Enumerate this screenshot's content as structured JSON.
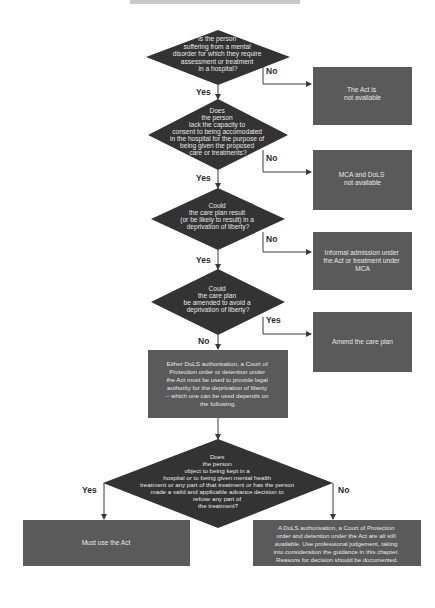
{
  "colors": {
    "diamond": "#333333",
    "box": "#5a5a5a",
    "line": "#3a3a3a",
    "text": "#e6e6e6",
    "label": "#2a2a2a"
  },
  "flowchart": {
    "decisions": [
      {
        "id": "d1",
        "lines": [
          "Is the person",
          "suffering from a mental",
          "disorder for which they require",
          "assessment or treatment",
          "in a hospital?"
        ]
      },
      {
        "id": "d2",
        "lines": [
          "Does",
          "the person",
          "lack the capacity to",
          "consent to being accomodated",
          "in the hospital for the purpose of",
          "being given the proposed",
          "care or treatments?"
        ]
      },
      {
        "id": "d3",
        "lines": [
          "Could",
          "the care plan result",
          "(or be likely to result) in a",
          "deprivation of liberty?"
        ]
      },
      {
        "id": "d4",
        "lines": [
          "Could",
          "the care plan",
          "be amended to avoid a",
          "deprivation of liberty?"
        ]
      },
      {
        "id": "d5",
        "lines": [
          "Does",
          "the person",
          "object to being kept in a",
          "hospital or to being given mental health",
          "treatment or any part of that treatment or has the person",
          "made a valid and applicable advance decision to",
          "refuse any part of",
          "the treatment?"
        ]
      }
    ],
    "outcomes": [
      {
        "id": "o1",
        "lines": [
          "The Act is",
          "not available"
        ]
      },
      {
        "id": "o2",
        "lines": [
          "MCA and DoLS",
          "not available"
        ]
      },
      {
        "id": "o3",
        "lines": [
          "Informal admission under",
          "the Act or treatment under",
          "MCA"
        ]
      },
      {
        "id": "o4",
        "lines": [
          "Amend the care plan"
        ]
      },
      {
        "id": "o5",
        "lines": [
          "Either DoLS authorisation, a Court of",
          "Protection order or detention under",
          "the Act must be used to provide legal",
          "authority for the deprivation of liberty",
          "– which one can be used depends on",
          "the following."
        ]
      },
      {
        "id": "o6",
        "lines": [
          "Must use the Act"
        ]
      },
      {
        "id": "o7",
        "lines": [
          "A DoLS authorisation, a Court of Protection",
          "order and detention under the Act are all still",
          "available. Use professional judgement, taking",
          "into consideration the guidance in this chapter.",
          "Reasons for decision should be documented."
        ]
      }
    ],
    "edge_labels": {
      "d1_yes": "Yes",
      "d1_no": "No",
      "d2_yes": "Yes",
      "d2_no": "No",
      "d3_yes": "Yes",
      "d3_no": "No",
      "d4_yes": "Yes",
      "d4_no": "No",
      "d5_yes": "Yes",
      "d5_no": "No"
    }
  }
}
